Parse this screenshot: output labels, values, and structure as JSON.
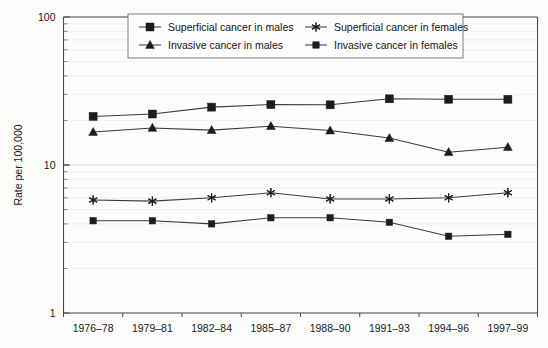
{
  "chart_data": {
    "type": "line",
    "title": "",
    "xlabel": "",
    "ylabel": "Rate per 100,000",
    "yscale": "log",
    "ylim": [
      1,
      100
    ],
    "ytick_labels": [
      "1",
      "10",
      "100"
    ],
    "ytick_values": [
      1,
      10,
      100
    ],
    "grid": true,
    "legend_position": "top-center",
    "categories": [
      "1976–78",
      "1979–81",
      "1982–84",
      "1985–87",
      "1988–90",
      "1991–93",
      "1994–96",
      "1997–99"
    ],
    "series": [
      {
        "name": "Superficial cancer in males",
        "marker": "square",
        "values": [
          21.3,
          22.1,
          24.6,
          25.6,
          25.5,
          28.0,
          27.8,
          27.8
        ]
      },
      {
        "name": "Superficial cancer in females",
        "marker": "star",
        "values": [
          5.8,
          5.7,
          6.0,
          6.5,
          5.9,
          5.9,
          6.0,
          6.5
        ]
      },
      {
        "name": "Invasive cancer in males",
        "marker": "triangle",
        "values": [
          16.7,
          17.8,
          17.2,
          18.3,
          17.1,
          15.2,
          12.2,
          13.2
        ]
      },
      {
        "name": "Invasive cancer in females",
        "marker": "square-small",
        "values": [
          4.2,
          4.2,
          4.0,
          4.4,
          4.4,
          4.1,
          3.3,
          3.4
        ]
      }
    ]
  },
  "legend": {
    "entries": [
      {
        "label": "Superficial cancer in males",
        "marker": "square"
      },
      {
        "label": "Superficial cancer in females",
        "marker": "star"
      },
      {
        "label": "Invasive cancer in males",
        "marker": "triangle"
      },
      {
        "label": "Invasive cancer in females",
        "marker": "square-small"
      }
    ]
  },
  "axes": {
    "y_title": "Rate per 100,000",
    "y_labels": [
      "100",
      "10",
      "1"
    ],
    "x_labels": [
      "1976–78",
      "1979–81",
      "1982–84",
      "1985–87",
      "1988–90",
      "1991–93",
      "1994–96",
      "1997–99"
    ]
  },
  "colors": {
    "line": "#3a3a3a",
    "marker": "#1c1c1c",
    "grid": "#d8d8d8",
    "axis": "#4a4a4a",
    "background": "#fbfbfa"
  }
}
